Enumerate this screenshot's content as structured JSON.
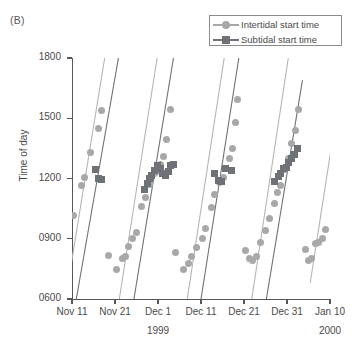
{
  "panel": {
    "label": "(B)"
  },
  "legend": {
    "position": "top-right",
    "entries": [
      {
        "label": "Intertidal start time",
        "marker": "circle-marker-icon",
        "color": "#a8a8a8"
      },
      {
        "label": "Subtidal start time",
        "marker": "square-marker-icon",
        "color": "#6e7176"
      }
    ]
  },
  "axes": {
    "y": {
      "label": "Time of day",
      "ticks": [
        "0600",
        "0900",
        "1200",
        "1500",
        "1800"
      ],
      "min": 600,
      "max": 1800
    },
    "x": {
      "ticks": [
        "Nov 11",
        "Nov 21",
        "Dec 1",
        "Dec 11",
        "Dec 21",
        "Dec 31",
        "Jan 10"
      ],
      "tick_days": [
        0,
        10,
        20,
        30,
        40,
        50,
        60
      ],
      "years": [
        {
          "text": "1999",
          "at_tick": 2
        },
        {
          "text": "2000",
          "at_tick": 6
        }
      ],
      "min_day": 0,
      "max_day": 60
    }
  },
  "chart_data": {
    "type": "scatter",
    "title": "(B)",
    "xlabel": "",
    "ylabel": "Time of day",
    "xlim": [
      0,
      60
    ],
    "ylim": [
      600,
      1800
    ],
    "xtick_labels": [
      "Nov 11",
      "Nov 21",
      "Dec 1",
      "Dec 11",
      "Dec 21",
      "Dec 31",
      "Jan 10"
    ],
    "xtick_values": [
      0,
      10,
      20,
      30,
      40,
      50,
      60
    ],
    "ytick_labels": [
      "0600",
      "0900",
      "1200",
      "1500",
      "1800"
    ],
    "ytick_values": [
      600,
      900,
      1200,
      1500,
      1800
    ],
    "grid": false,
    "legend_position": "upper right",
    "series": [
      {
        "name": "Intertidal start time",
        "marker": "circle",
        "color": "#a8a8a8",
        "points": [
          [
            0.3,
            1015
          ],
          [
            2.3,
            1165
          ],
          [
            3.0,
            1205
          ],
          [
            4.4,
            1330
          ],
          [
            6.1,
            1450
          ],
          [
            6.8,
            1540
          ],
          [
            8.5,
            815
          ],
          [
            10.4,
            745
          ],
          [
            11.8,
            800
          ],
          [
            12.4,
            810
          ],
          [
            13.2,
            860
          ],
          [
            14.1,
            900
          ],
          [
            14.9,
            930
          ],
          [
            16.2,
            1060
          ],
          [
            17.2,
            1105
          ],
          [
            18.0,
            1170
          ],
          [
            19.1,
            1225
          ],
          [
            19.6,
            1235
          ],
          [
            20.6,
            1270
          ],
          [
            21.3,
            1310
          ],
          [
            22.0,
            1395
          ],
          [
            22.9,
            1545
          ],
          [
            24.0,
            830
          ],
          [
            26.0,
            745
          ],
          [
            27.2,
            775
          ],
          [
            27.8,
            810
          ],
          [
            29.0,
            855
          ],
          [
            30.3,
            900
          ],
          [
            31.1,
            950
          ],
          [
            32.5,
            1055
          ],
          [
            33.2,
            1120
          ],
          [
            34.4,
            1180
          ],
          [
            35.3,
            1205
          ],
          [
            36.6,
            1300
          ],
          [
            37.4,
            1350
          ],
          [
            38.0,
            1480
          ],
          [
            38.6,
            1595
          ],
          [
            40.4,
            840
          ],
          [
            41.2,
            800
          ],
          [
            42.0,
            790
          ],
          [
            42.8,
            810
          ],
          [
            43.9,
            880
          ],
          [
            44.9,
            940
          ],
          [
            46.0,
            1000
          ],
          [
            47.1,
            1075
          ],
          [
            47.9,
            1130
          ],
          [
            48.6,
            1165
          ],
          [
            49.5,
            1245
          ],
          [
            50.3,
            1300
          ],
          [
            51.1,
            1375
          ],
          [
            51.9,
            1440
          ],
          [
            52.7,
            1545
          ],
          [
            54.2,
            845
          ],
          [
            55.0,
            790
          ],
          [
            55.8,
            800
          ],
          [
            56.6,
            875
          ],
          [
            57.4,
            880
          ],
          [
            58.2,
            900
          ],
          [
            58.9,
            945
          ]
        ]
      },
      {
        "name": "Subtidal start time",
        "marker": "square",
        "color": "#6e7176",
        "points": [
          [
            5.5,
            1245
          ],
          [
            6.1,
            1200
          ],
          [
            6.9,
            1195
          ],
          [
            16.8,
            1145
          ],
          [
            17.5,
            1175
          ],
          [
            18.1,
            1200
          ],
          [
            18.6,
            1215
          ],
          [
            19.2,
            1240
          ],
          [
            19.9,
            1265
          ],
          [
            20.5,
            1250
          ],
          [
            21.1,
            1225
          ],
          [
            21.7,
            1215
          ],
          [
            22.4,
            1235
          ],
          [
            23.0,
            1265
          ],
          [
            23.7,
            1270
          ],
          [
            33.2,
            1225
          ],
          [
            34.0,
            1190
          ],
          [
            34.8,
            1185
          ],
          [
            35.6,
            1250
          ],
          [
            37.2,
            1240
          ],
          [
            47.0,
            1185
          ],
          [
            48.0,
            1210
          ],
          [
            48.6,
            1225
          ],
          [
            49.2,
            1250
          ],
          [
            49.8,
            1255
          ],
          [
            50.4,
            1280
          ],
          [
            51.1,
            1300
          ],
          [
            51.8,
            1320
          ],
          [
            52.4,
            1350
          ]
        ]
      }
    ],
    "prediction_lines": [
      {
        "series": "Intertidal start time",
        "color": "#b5b5b5",
        "x": [
          -1.5,
          7.6
        ],
        "y": [
          600,
          1800
        ]
      },
      {
        "series": "Subtidal start time",
        "color": "#6e7176",
        "x": [
          1.0,
          10.8
        ],
        "y": [
          600,
          1800
        ]
      },
      {
        "series": "Intertidal start time",
        "color": "#b5b5b5",
        "x": [
          11.0,
          19.8
        ],
        "y": [
          600,
          1800
        ]
      },
      {
        "series": "Subtidal start time",
        "color": "#6e7176",
        "x": [
          14.4,
          23.6
        ],
        "y": [
          600,
          1800
        ]
      },
      {
        "series": "Intertidal start time",
        "color": "#b5b5b5",
        "x": [
          26.8,
          35.4
        ],
        "y": [
          600,
          1800
        ]
      },
      {
        "series": "Subtidal start time",
        "color": "#6e7176",
        "x": [
          30.0,
          38.8
        ],
        "y": [
          600,
          1800
        ]
      },
      {
        "series": "Intertidal start time",
        "color": "#b5b5b5",
        "x": [
          41.8,
          50.3
        ],
        "y": [
          600,
          1800
        ]
      },
      {
        "series": "Subtidal start time",
        "color": "#6e7176",
        "x": [
          45.2,
          53.6
        ],
        "y": [
          600,
          1690
        ]
      },
      {
        "series": "Intertidal start time",
        "color": "#b5b5b5",
        "x": [
          55.4,
          60.2
        ],
        "y": [
          680,
          1340
        ]
      }
    ]
  }
}
